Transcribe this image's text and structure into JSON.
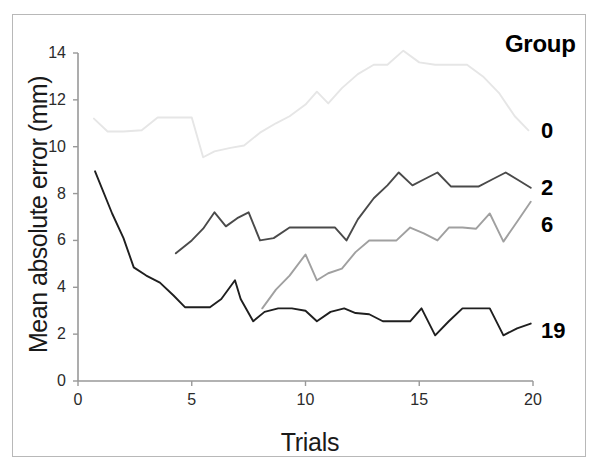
{
  "figure": {
    "background": "#ffffff",
    "frame_color": "#b8b8b8"
  },
  "axes": {
    "x_label": "Trials",
    "y_label": "Mean absolute error (mm)",
    "x_ticks": [
      "0",
      "5",
      "10",
      "15",
      "20"
    ],
    "y_ticks": [
      "0",
      "2",
      "4",
      "6",
      "8",
      "10",
      "12",
      "14"
    ]
  },
  "legend": {
    "title": "Group",
    "entries": [
      {
        "label": "0",
        "color": "#e6e6e6"
      },
      {
        "label": "2",
        "color": "#4a4a4a"
      },
      {
        "label": "6",
        "color": "#a0a0a0"
      },
      {
        "label": "19",
        "color": "#1f1f1f"
      }
    ]
  },
  "chart_data": {
    "type": "line",
    "title": "",
    "xlabel": "Trials",
    "ylabel": "Mean absolute error (mm)",
    "xlim": [
      0,
      20
    ],
    "ylim": [
      0,
      14
    ],
    "xticks": [
      0,
      5,
      10,
      15,
      20
    ],
    "yticks": [
      0,
      2,
      4,
      6,
      8,
      10,
      12,
      14
    ],
    "grid": false,
    "legend_position": "right",
    "legend_title": "Group",
    "series": [
      {
        "name": "0",
        "color": "#e6e6e6",
        "x": [
          0.7,
          1.3,
          2.0,
          2.8,
          3.5,
          4.2,
          5.0,
          5.5,
          6.0,
          6.7,
          7.3,
          8.0,
          8.7,
          9.3,
          10.0,
          10.5,
          11.0,
          11.6,
          12.3,
          13.0,
          13.6,
          14.3,
          15.0,
          15.7,
          16.4,
          17.1,
          17.8,
          18.5,
          19.2,
          19.8
        ],
        "y": [
          11.2,
          10.65,
          10.65,
          10.7,
          11.25,
          11.25,
          11.25,
          9.55,
          9.8,
          9.95,
          10.05,
          10.6,
          11.0,
          11.3,
          11.8,
          12.35,
          11.85,
          12.5,
          13.1,
          13.5,
          13.5,
          14.1,
          13.6,
          13.5,
          13.5,
          13.5,
          13.0,
          12.3,
          11.3,
          10.7
        ]
      },
      {
        "name": "2",
        "color": "#4a4a4a",
        "x": [
          4.3,
          5.0,
          5.5,
          6.0,
          6.5,
          7.0,
          7.5,
          8.0,
          8.6,
          9.3,
          10.0,
          10.7,
          11.3,
          11.8,
          12.3,
          13.0,
          13.6,
          14.1,
          14.7,
          15.2,
          15.8,
          16.4,
          17.0,
          17.6,
          18.2,
          18.8,
          19.4,
          19.9
        ],
        "y": [
          5.45,
          6.0,
          6.5,
          7.2,
          6.6,
          6.95,
          7.2,
          6.0,
          6.1,
          6.55,
          6.55,
          6.55,
          6.55,
          6.0,
          6.9,
          7.8,
          8.35,
          8.9,
          8.35,
          8.6,
          8.9,
          8.3,
          8.3,
          8.3,
          8.6,
          8.9,
          8.55,
          8.25
        ]
      },
      {
        "name": "6",
        "color": "#a0a0a0",
        "x": [
          8.1,
          8.7,
          9.3,
          10.0,
          10.5,
          11.0,
          11.6,
          12.2,
          12.8,
          13.4,
          14.0,
          14.6,
          15.2,
          15.8,
          16.3,
          16.9,
          17.5,
          18.1,
          18.7,
          19.3,
          19.9
        ],
        "y": [
          3.1,
          3.9,
          4.5,
          5.4,
          4.3,
          4.6,
          4.8,
          5.5,
          6.0,
          6.0,
          6.0,
          6.55,
          6.3,
          6.0,
          6.55,
          6.55,
          6.5,
          7.15,
          5.95,
          6.8,
          7.65
        ]
      },
      {
        "name": "19",
        "color": "#1f1f1f",
        "x": [
          0.75,
          1.5,
          2.0,
          2.45,
          3.0,
          3.6,
          4.2,
          4.7,
          5.2,
          5.8,
          6.3,
          6.9,
          7.15,
          7.7,
          8.2,
          8.8,
          9.4,
          10.0,
          10.5,
          11.1,
          11.7,
          12.2,
          12.8,
          13.4,
          14.0,
          14.6,
          15.1,
          15.7,
          16.3,
          16.9,
          17.5,
          18.1,
          18.7,
          19.3,
          19.9
        ],
        "y": [
          8.95,
          7.15,
          6.1,
          4.85,
          4.5,
          4.2,
          3.65,
          3.15,
          3.15,
          3.15,
          3.5,
          4.3,
          3.5,
          2.55,
          2.95,
          3.1,
          3.1,
          3.0,
          2.55,
          2.95,
          3.1,
          2.9,
          2.85,
          2.55,
          2.55,
          2.55,
          3.1,
          1.95,
          2.55,
          3.1,
          3.1,
          3.1,
          1.95,
          2.25,
          2.45
        ]
      }
    ]
  }
}
